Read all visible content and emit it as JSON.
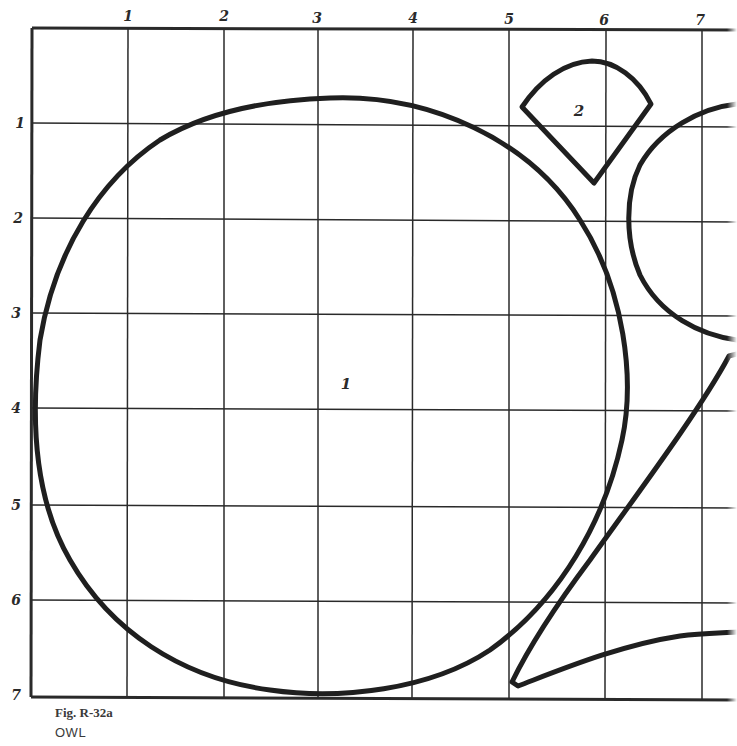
{
  "figure": {
    "caption": "Fig. R-32a",
    "title": "OWL"
  },
  "grid": {
    "column_labels": [
      "1",
      "2",
      "3",
      "4",
      "5",
      "6",
      "7"
    ],
    "row_labels": [
      "1",
      "2",
      "3",
      "4",
      "5",
      "6",
      "7"
    ],
    "line_color": "#2a2a2a",
    "shape_color": "#1f1f1f"
  },
  "pieces": [
    {
      "id": "1",
      "label": "1",
      "description": "large circle (owl body/head)"
    },
    {
      "id": "2",
      "label": "2",
      "description": "fan-shaped wedge (beak/ear)"
    },
    {
      "id": "eye-arc",
      "label": "",
      "description": "partial circle at right edge"
    },
    {
      "id": "wing",
      "label": "",
      "description": "tapered wing/claw shape lower right"
    }
  ]
}
